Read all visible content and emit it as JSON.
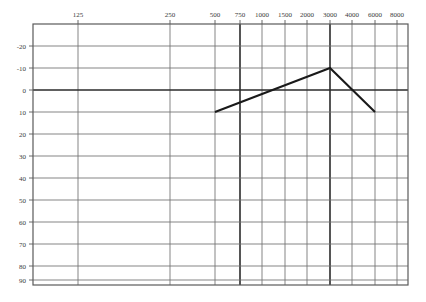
{
  "chart_data": {
    "type": "line",
    "title": "",
    "subtitle": "",
    "xlabel": "",
    "ylabel": "",
    "grid": true,
    "legend": false,
    "x_axis": {
      "position": "top",
      "scale": "categorical-log-frequency",
      "tick_labels": [
        "125",
        "250",
        "500",
        "750",
        "1000",
        "1500",
        "2000",
        "3000",
        "4000",
        "6000",
        "8000"
      ],
      "tick_values": [
        125,
        250,
        500,
        750,
        1000,
        1500,
        2000,
        3000,
        4000,
        6000,
        8000
      ],
      "emphasized_ticks": [
        750,
        3000
      ]
    },
    "y_axis": {
      "position": "left",
      "inverted": true,
      "tick_labels": [
        "-20",
        "-10",
        "0",
        "10",
        "20",
        "30",
        "40",
        "50",
        "60",
        "70",
        "80",
        "90"
      ],
      "tick_values": [
        -20,
        -10,
        0,
        10,
        20,
        30,
        40,
        50,
        60,
        70,
        80,
        90
      ],
      "ylim": [
        -20,
        90
      ],
      "emphasized_ticks": [
        0
      ]
    },
    "series": [
      {
        "name": "threshold",
        "color": "#1a1a1a",
        "points": [
          {
            "x": 500,
            "y": 10
          },
          {
            "x": 3000,
            "y": -10
          },
          {
            "x": 6000,
            "y": 10
          }
        ]
      }
    ]
  },
  "geometry": {
    "plot_left": 33,
    "plot_right": 408,
    "plot_top": 24,
    "plot_bottom": 285,
    "x_positions": [
      78,
      170,
      215,
      260,
      305,
      350,
      395,
      440,
      485,
      530,
      575
    ],
    "x_pixel": {
      "125": 78,
      "250": 170,
      "500": 215,
      "750": 240,
      "1000": 262,
      "1500": 285,
      "2000": 307,
      "3000": 330,
      "4000": 352,
      "6000": 375,
      "8000": 397
    },
    "y_pixel": {
      "-20": 46,
      "-10": 68,
      "0": 90,
      "10": 112,
      "20": 134,
      "30": 156,
      "40": 178,
      "50": 200,
      "60": 222,
      "70": 244,
      "80": 266,
      "90": 280
    }
  },
  "colors": {
    "grid_line": "#6f6f6f",
    "grid_line_light": "#8a8a8a",
    "axis_border": "#5a5a5a",
    "emphasis_line": "#2b2b2b",
    "data_line": "#1a1a1a",
    "label_text": "#3a3a3a",
    "background": "#ffffff"
  }
}
